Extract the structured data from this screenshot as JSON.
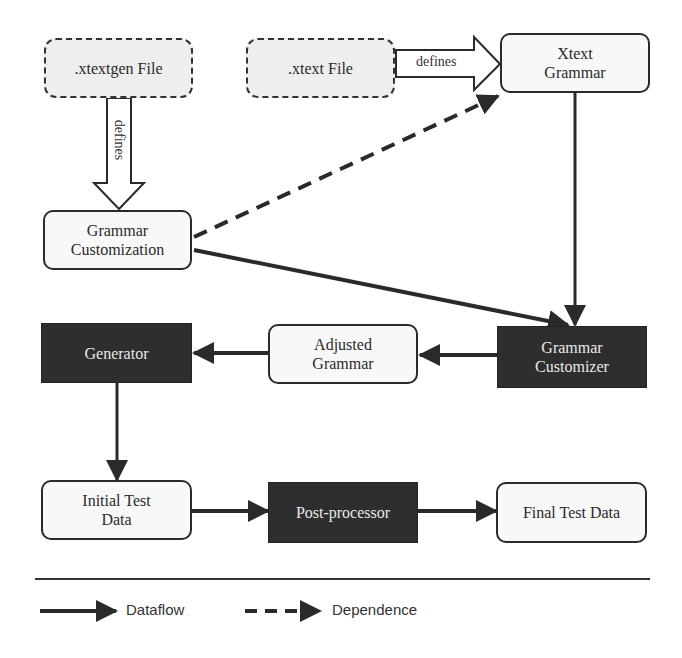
{
  "diagram": {
    "nodes": {
      "xtextgen_file": {
        "label": ".xtextgen File",
        "kind": "file"
      },
      "xtext_file": {
        "label": ".xtext File",
        "kind": "file"
      },
      "xtext_grammar": {
        "line1": "Xtext",
        "line2": "Grammar",
        "kind": "data"
      },
      "grammar_customization": {
        "line1": "Grammar",
        "line2": "Customization",
        "kind": "data"
      },
      "generator": {
        "label": "Generator",
        "kind": "process"
      },
      "adjusted_grammar": {
        "line1": "Adjusted",
        "line2": "Grammar",
        "kind": "data"
      },
      "grammar_customizer": {
        "line1": "Grammar",
        "line2": "Customizer",
        "kind": "process"
      },
      "initial_test_data": {
        "line1": "Initial Test",
        "line2": "Data",
        "kind": "data"
      },
      "post_processor": {
        "label": "Post-processor",
        "kind": "process"
      },
      "final_test_data": {
        "label": "Final Test Data",
        "kind": "data"
      }
    },
    "edges": [
      {
        "from": ".xtextgen File",
        "to": "Grammar Customization",
        "type": "defines",
        "label": "defines"
      },
      {
        "from": ".xtext File",
        "to": "Xtext Grammar",
        "type": "defines",
        "label": "defines"
      },
      {
        "from": "Grammar Customization",
        "to": "Xtext Grammar",
        "type": "dependence"
      },
      {
        "from": "Grammar Customization",
        "to": "Grammar Customizer",
        "type": "dataflow"
      },
      {
        "from": "Xtext Grammar",
        "to": "Grammar Customizer",
        "type": "dataflow"
      },
      {
        "from": "Grammar Customizer",
        "to": "Adjusted Grammar",
        "type": "dataflow"
      },
      {
        "from": "Adjusted Grammar",
        "to": "Generator",
        "type": "dataflow"
      },
      {
        "from": "Generator",
        "to": "Initial Test Data",
        "type": "dataflow"
      },
      {
        "from": "Initial Test Data",
        "to": "Post-processor",
        "type": "dataflow"
      },
      {
        "from": "Post-processor",
        "to": "Final Test Data",
        "type": "dataflow"
      }
    ],
    "edge_labels": {
      "defines_vertical": "defines",
      "defines_horizontal": "defines"
    }
  },
  "legend": {
    "dataflow": "Dataflow",
    "dependence": "Dependence"
  },
  "colors": {
    "process_fill": "#2e2e2e",
    "file_fill": "#eeeeee",
    "data_fill": "#f8f8f8",
    "stroke": "#2a2a2a"
  }
}
